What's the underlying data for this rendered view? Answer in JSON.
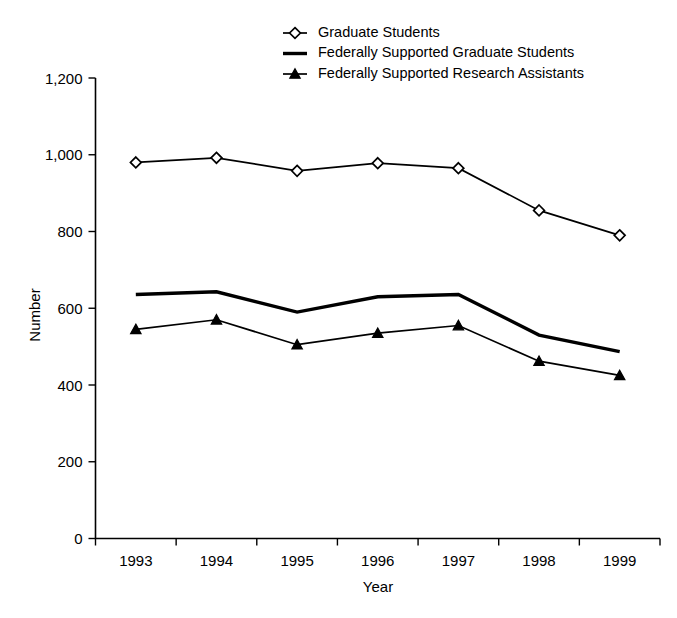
{
  "chart_data": {
    "type": "line",
    "title": "",
    "xlabel": "Year",
    "ylabel": "Number",
    "categories": [
      "1993",
      "1994",
      "1995",
      "1996",
      "1997",
      "1998",
      "1999"
    ],
    "x": [
      1993,
      1994,
      1995,
      1996,
      1997,
      1998,
      1999
    ],
    "ylim": [
      0,
      1200
    ],
    "yticks": [
      0,
      200,
      400,
      600,
      800,
      1000,
      1200
    ],
    "ytick_labels": [
      "0",
      "200",
      "400",
      "600",
      "800",
      "1,000",
      "1,200"
    ],
    "grid": false,
    "legend_position": "top-center",
    "series": [
      {
        "name": "Graduate Students",
        "marker": "open-diamond",
        "line_style": "thin",
        "values": [
          980,
          992,
          958,
          978,
          965,
          855,
          790
        ]
      },
      {
        "name": "Federally Supported Graduate Students",
        "marker": "none",
        "line_style": "thick",
        "values": [
          636,
          643,
          590,
          630,
          636,
          530,
          487
        ]
      },
      {
        "name": "Federally Supported Research Assistants",
        "marker": "solid-triangle",
        "line_style": "thin",
        "values": [
          545,
          570,
          505,
          535,
          555,
          462,
          425
        ]
      }
    ]
  },
  "legend": {
    "items": [
      {
        "label": "Graduate Students",
        "marker": "open-diamond"
      },
      {
        "label": "Federally Supported Graduate Students",
        "marker": "none"
      },
      {
        "label": "Federally Supported Research Assistants",
        "marker": "solid-triangle"
      }
    ]
  },
  "axes": {
    "y_title": "Number",
    "x_title": "Year"
  },
  "colors": {
    "foreground": "#000000",
    "background": "#ffffff"
  }
}
